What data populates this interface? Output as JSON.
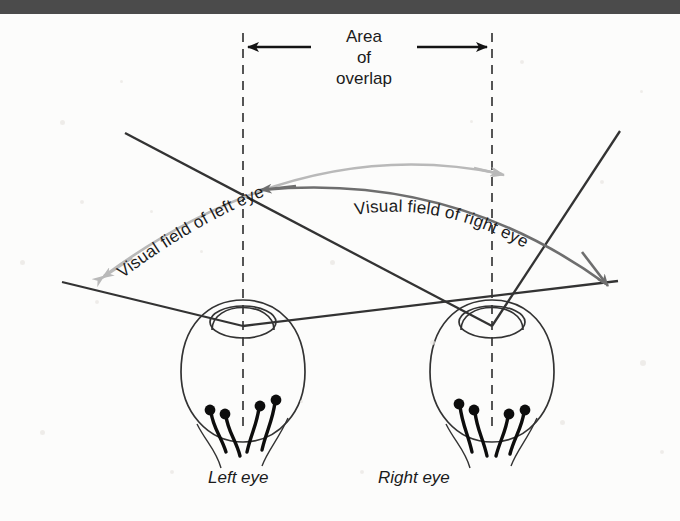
{
  "figure": {
    "background_color": "#fcfcfb",
    "top_bar_color": "#4b4b4b",
    "ink_color": "#1b1b1b"
  },
  "labels": {
    "area_of_overlap": {
      "line1": "Area",
      "line2": "of",
      "line3": "overlap"
    },
    "visual_field_left": "Visual field of left eye",
    "visual_field_right": "Visual field of right eye",
    "left_eye": "Left eye",
    "right_eye": "Right eye"
  },
  "arcs": [
    {
      "name": "left-eye-visual-field-arc",
      "label": "Visual field of left eye",
      "color": "#b9b9b9",
      "start": [
        104,
        276
      ],
      "end": [
        502,
        174
      ],
      "arrow_ends": "both"
    },
    {
      "name": "right-eye-visual-field-arc",
      "label": "Visual field of right eye",
      "color": "#6e6e6e",
      "start": [
        262,
        190
      ],
      "end": [
        606,
        284
      ],
      "arrow_ends": "both"
    }
  ],
  "overlap_markers": {
    "left_dashed_x": 243,
    "right_dashed_x": 492,
    "dash_top_y": 33,
    "dash_bottom_y": 430,
    "arrow_y": 47,
    "dash_color": "#555555"
  },
  "eyes": [
    {
      "name": "left-eye",
      "label": "Left eye",
      "center_x": 243,
      "globe_center_y": 372,
      "globe_rx": 62,
      "globe_ry": 70,
      "lens_cy": 320,
      "lens_rx": 34,
      "lens_ry": 17,
      "receptor_count": 4
    },
    {
      "name": "right-eye",
      "label": "Right eye",
      "center_x": 492,
      "globe_center_y": 372,
      "globe_rx": 62,
      "globe_ry": 70,
      "lens_cy": 320,
      "lens_rx": 34,
      "lens_ry": 17,
      "receptor_count": 4
    }
  ],
  "sight_lines": {
    "color": "#333333",
    "description": "Two straight rays cross at each pupil, projecting outward to the visual field limits"
  }
}
